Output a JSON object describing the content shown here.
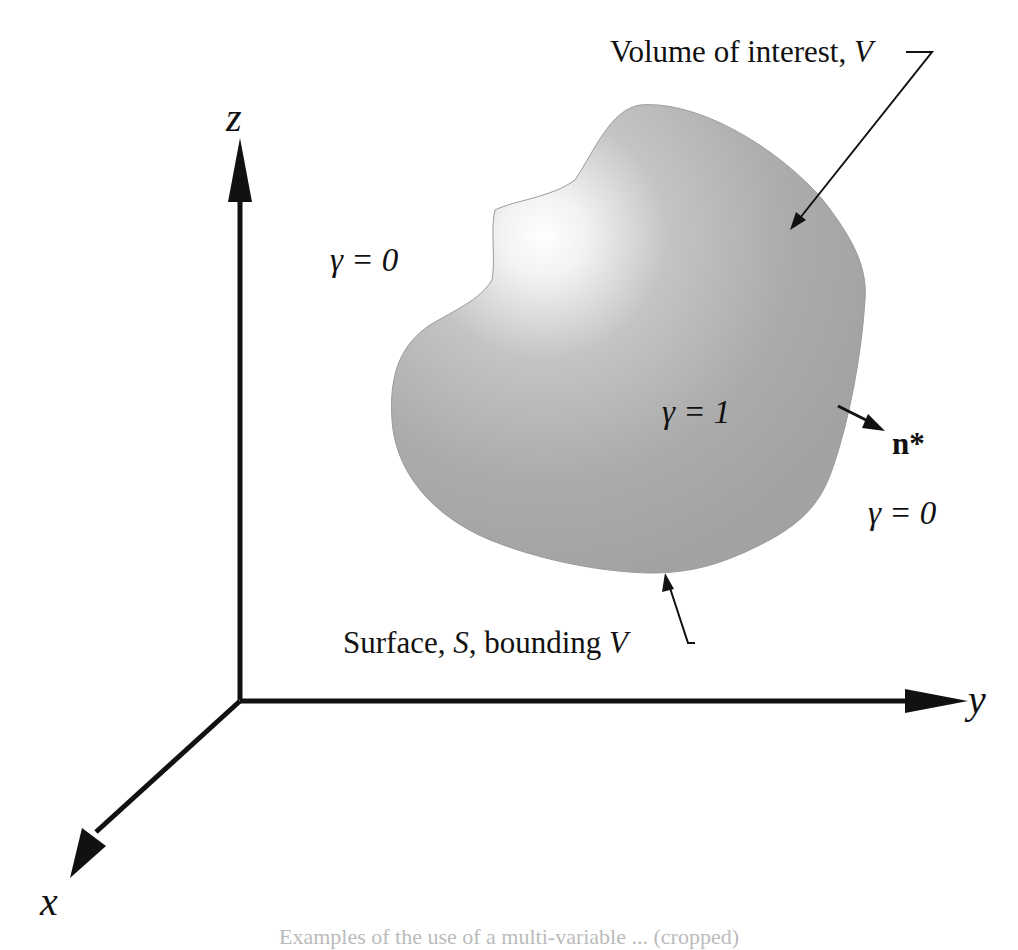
{
  "figure": {
    "axes": {
      "x_label": "x",
      "y_label": "y",
      "z_label": "z"
    },
    "regions": {
      "outside_left": "γ = 0",
      "outside_right": "γ = 0",
      "inside": "γ = 1"
    },
    "annotations": {
      "volume_label": "Volume of interest, ",
      "volume_symbol": "V",
      "surface_label_prefix": "Surface, ",
      "surface_symbol": "S",
      "surface_label_suffix": ", bounding ",
      "surface_bounding_symbol": "V",
      "normal_label": "n*"
    },
    "colors": {
      "shape_fill": "#a9a9a9",
      "highlight": "#ffffff",
      "ink": "#111111"
    },
    "caption_fragment": "Examples of the use of a multi-variable ... (cropped)"
  }
}
